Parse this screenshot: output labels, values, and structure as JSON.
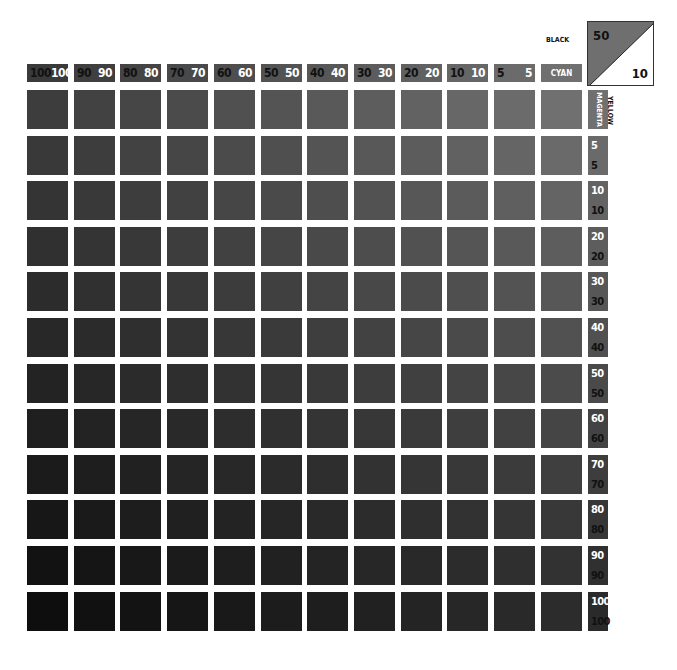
{
  "chart_data": {
    "type": "heatmap",
    "corner": {
      "black_label": "BLACK",
      "black_value": "50",
      "yellow_label": "YELLOW",
      "yellow_value": "10"
    },
    "column_axis_label": "CYAN",
    "row_axis_label": "MAGENTA",
    "columns": [
      {
        "a": "100",
        "b": "100"
      },
      {
        "a": "90",
        "b": "90"
      },
      {
        "a": "80",
        "b": "80"
      },
      {
        "a": "70",
        "b": "70"
      },
      {
        "a": "60",
        "b": "60"
      },
      {
        "a": "50",
        "b": "50"
      },
      {
        "a": "40",
        "b": "40"
      },
      {
        "a": "30",
        "b": "30"
      },
      {
        "a": "20",
        "b": "20"
      },
      {
        "a": "10",
        "b": "10"
      },
      {
        "a": "5",
        "b": "5"
      },
      {
        "a": "CYAN",
        "b": ""
      }
    ],
    "rows": [
      {
        "a": "MAGENTA",
        "b": ""
      },
      {
        "a": "5",
        "b": "5"
      },
      {
        "a": "10",
        "b": "10"
      },
      {
        "a": "20",
        "b": "20"
      },
      {
        "a": "30",
        "b": "30"
      },
      {
        "a": "40",
        "b": "40"
      },
      {
        "a": "50",
        "b": "50"
      },
      {
        "a": "60",
        "b": "60"
      },
      {
        "a": "70",
        "b": "70"
      },
      {
        "a": "80",
        "b": "80"
      },
      {
        "a": "90",
        "b": "90"
      },
      {
        "a": "100",
        "b": "100"
      }
    ],
    "column_values": [
      100,
      90,
      80,
      70,
      60,
      50,
      40,
      30,
      20,
      10,
      5,
      0
    ],
    "row_values": [
      0,
      5,
      10,
      20,
      30,
      40,
      50,
      60,
      70,
      80,
      90,
      100
    ],
    "tone_range": {
      "top_left": "#3d3d3d",
      "top_right": "#707070",
      "bottom_left": "#0e0e0e",
      "bottom_right": "#2c2c2c"
    },
    "grid": false,
    "legend": "none"
  }
}
